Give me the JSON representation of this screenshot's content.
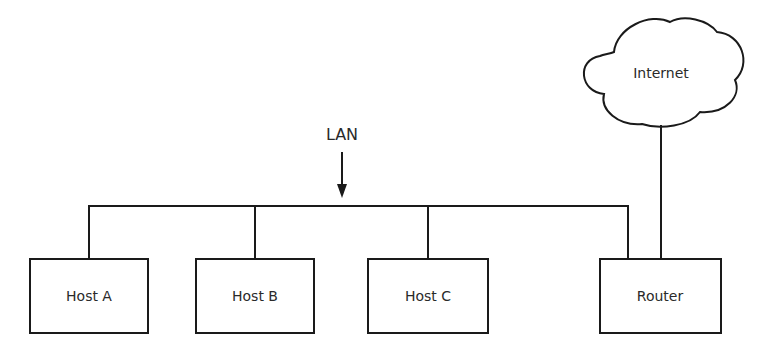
{
  "diagram": {
    "lan_label": "LAN",
    "cloud_label": "Internet",
    "nodes": [
      {
        "id": "host-a",
        "label": "Host A"
      },
      {
        "id": "host-b",
        "label": "Host B"
      },
      {
        "id": "host-c",
        "label": "Host C"
      },
      {
        "id": "router",
        "label": "Router"
      }
    ],
    "colors": {
      "stroke": "#1a1a1a",
      "text": "#2a2a2a",
      "background": "#ffffff"
    }
  }
}
